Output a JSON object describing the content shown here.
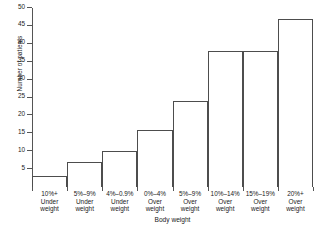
{
  "chart_data": {
    "type": "bar",
    "title": "",
    "xlabel": "Body weight",
    "ylabel": "Number of patients",
    "categories": [
      "10%+\nUnder\nweight",
      "5%–9%\nUnder\nweight",
      "4%–0.9%\nUnder\nweight",
      "0%–4%\nOver\nweight",
      "5%–9%\nOver\nweight",
      "10%–14%\nOver\nweight",
      "15%–19%\nOver\nweight",
      "20%+\nOver\nweight"
    ],
    "category_lines": [
      [
        "10%+",
        "Under",
        "weight"
      ],
      [
        "5%–9%",
        "Under",
        "weight"
      ],
      [
        "4%–0.9%",
        "Under",
        "weight"
      ],
      [
        "0%–4%",
        "Over",
        "weight"
      ],
      [
        "5%–9%",
        "Over",
        "weight"
      ],
      [
        "10%–14%",
        "Over",
        "weight"
      ],
      [
        "15%–19%",
        "Over",
        "weight"
      ],
      [
        "20%+",
        "Over",
        "weight"
      ]
    ],
    "values": [
      3,
      7,
      10,
      16,
      24,
      38,
      38,
      47
    ],
    "ylim": [
      0,
      50
    ],
    "yticks": [
      5,
      10,
      15,
      20,
      25,
      30,
      35,
      40,
      45,
      50
    ],
    "ytick_labels": [
      "5",
      "10",
      "15",
      "20",
      "25",
      "30",
      "35",
      "40",
      "45",
      "50"
    ],
    "grid": false,
    "legend": null,
    "bar_edge_color": "#4d4d4d",
    "bar_fill_color": "#ffffff",
    "axis_color": "#555555"
  }
}
